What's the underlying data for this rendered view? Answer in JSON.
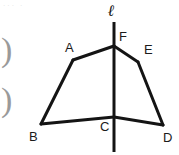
{
  "figure": {
    "stroke_color": "#141414",
    "background_color": "#ffffff",
    "line_width": 3,
    "axis_line_width": 3,
    "labels": {
      "line_l": "ℓ",
      "vertex_a": "A",
      "vertex_b": "B",
      "vertex_c": "C",
      "vertex_d": "D",
      "vertex_e": "E",
      "vertex_f": "F"
    },
    "margin_marks": {
      "mark_one": ")",
      "mark_two": ")"
    },
    "corner_artifact": "··· ·",
    "points": {
      "F": [
        114,
        46
      ],
      "A": [
        73,
        60
      ],
      "E": [
        138,
        62
      ],
      "B": [
        41,
        124
      ],
      "C": [
        114,
        117
      ],
      "D": [
        163,
        125
      ]
    },
    "segments": [
      {
        "name": "segment-FA",
        "from": "F",
        "to": "A"
      },
      {
        "name": "segment-AB",
        "from": "A",
        "to": "B"
      },
      {
        "name": "segment-BC",
        "from": "B",
        "to": "C"
      },
      {
        "name": "segment-CD",
        "from": "C",
        "to": "D"
      },
      {
        "name": "segment-DE",
        "from": "D",
        "to": "E"
      },
      {
        "name": "segment-EF",
        "from": "E",
        "to": "F"
      }
    ],
    "axis": {
      "name": "line-l",
      "x": 114,
      "y_top": 22,
      "y_bottom": 152
    }
  }
}
